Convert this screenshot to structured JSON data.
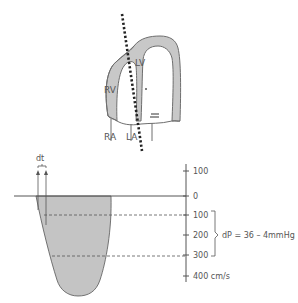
{
  "heart": {
    "labels": {
      "lv": "LV",
      "rv": "RV",
      "ra": "RA",
      "la": "LA"
    },
    "colors": {
      "myocardium_fill": "#c8c8c8",
      "outline": "#6e6e6e",
      "beam": "#222222"
    }
  },
  "doppler": {
    "dt_label": "dt",
    "fill_color": "#c4c4c4",
    "axis": {
      "ticks": [
        {
          "label": "100",
          "value": 100
        },
        {
          "label": "0",
          "value": 0
        },
        {
          "label": "100",
          "value": -100
        },
        {
          "label": "200",
          "value": -200
        },
        {
          "label": "300",
          "value": -300
        },
        {
          "label": "400 cm/s",
          "value": -400
        }
      ]
    },
    "annotation": "dP = 36 – 4mmHg"
  }
}
